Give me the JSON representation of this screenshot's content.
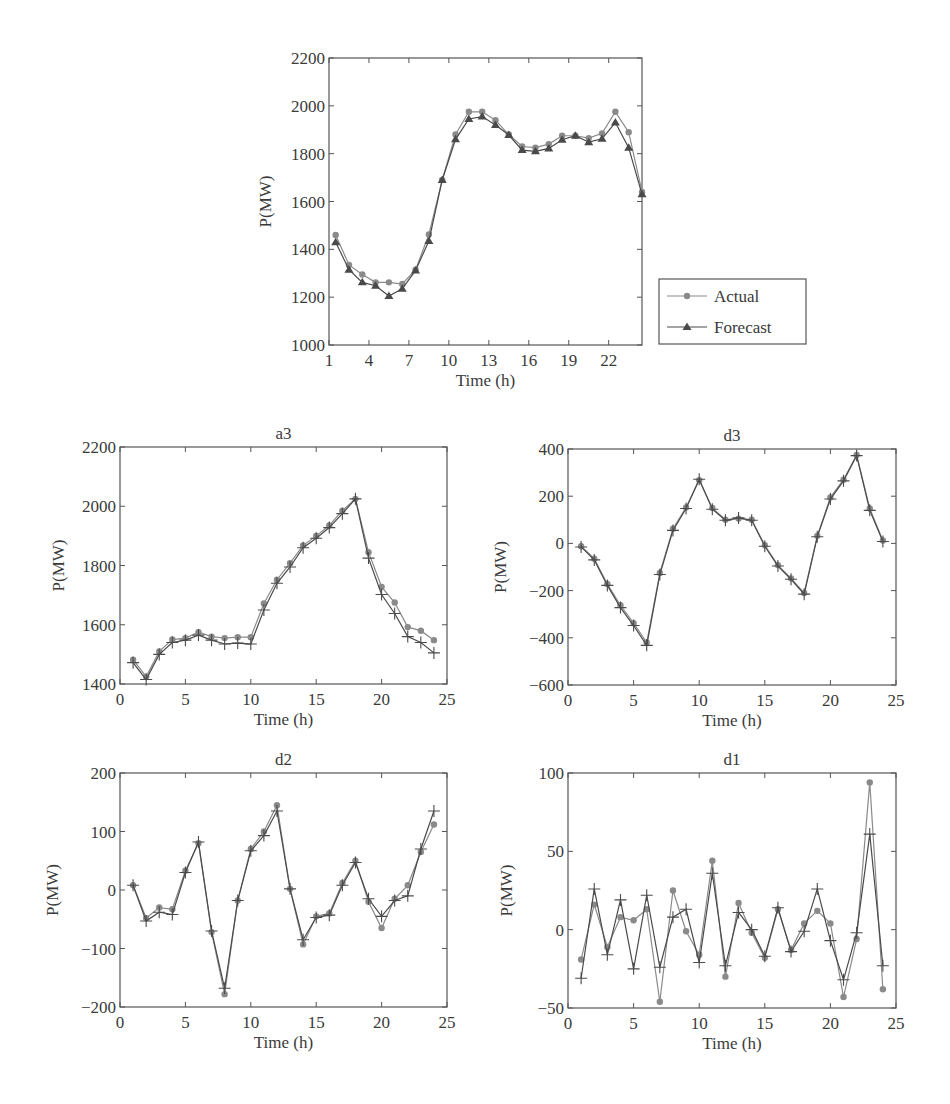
{
  "chart_data": [
    {
      "id": "main",
      "type": "line",
      "title": "",
      "xlabel": "Time (h)",
      "ylabel": "P(MW)",
      "xlim": [
        1,
        24.5
      ],
      "ylim": [
        1000,
        2200
      ],
      "xticks": [
        1,
        4,
        7,
        10,
        13,
        16,
        19,
        22
      ],
      "yticks": [
        1000,
        1200,
        1400,
        1600,
        1800,
        2000,
        2200
      ],
      "grid": false,
      "legend_position": "outside-right",
      "x": [
        1.5,
        2.5,
        3.5,
        4.5,
        5.5,
        6.5,
        7.5,
        8.5,
        9.5,
        10.5,
        11.5,
        12.5,
        13.5,
        14.5,
        15.5,
        16.5,
        17.5,
        18.5,
        19.5,
        20.5,
        21.5,
        22.5,
        23.5,
        24.5
      ],
      "series": [
        {
          "name": "Actual",
          "marker": "circle",
          "color": "#8a8a8a",
          "values": [
            1460,
            1335,
            1295,
            1262,
            1262,
            1255,
            1315,
            1462,
            1690,
            1880,
            1975,
            1975,
            1940,
            1880,
            1830,
            1825,
            1840,
            1875,
            1875,
            1865,
            1885,
            1975,
            1890,
            1640
          ]
        },
        {
          "name": "Forecast",
          "marker": "triangle",
          "color": "#4a4a4a",
          "values": [
            1430,
            1315,
            1262,
            1248,
            1205,
            1235,
            1312,
            1435,
            1690,
            1860,
            1945,
            1955,
            1920,
            1878,
            1815,
            1810,
            1822,
            1858,
            1875,
            1848,
            1862,
            1930,
            1825,
            1630
          ]
        }
      ]
    },
    {
      "id": "a3",
      "type": "line",
      "title": "a3",
      "xlabel": "Time (h)",
      "ylabel": "P(MW)",
      "xlim": [
        0,
        25
      ],
      "ylim": [
        1400,
        2200
      ],
      "xticks": [
        0,
        5,
        10,
        15,
        20,
        25
      ],
      "yticks": [
        1400,
        1600,
        1800,
        2000,
        2200
      ],
      "grid": false,
      "x": [
        1,
        2,
        3,
        4,
        5,
        6,
        7,
        8,
        9,
        10,
        11,
        12,
        13,
        14,
        15,
        16,
        17,
        18,
        19,
        20,
        21,
        22,
        23,
        24
      ],
      "series": [
        {
          "name": "Actual",
          "marker": "circle",
          "color": "#8a8a8a",
          "values": [
            1482,
            1425,
            1510,
            1550,
            1555,
            1575,
            1560,
            1555,
            1558,
            1558,
            1672,
            1752,
            1808,
            1868,
            1900,
            1935,
            1985,
            2025,
            1845,
            1728,
            1675,
            1592,
            1580,
            1548
          ]
        },
        {
          "name": "Forecast",
          "marker": "plus",
          "color": "#4a4a4a",
          "values": [
            1472,
            1415,
            1500,
            1540,
            1548,
            1565,
            1548,
            1535,
            1538,
            1535,
            1650,
            1740,
            1795,
            1860,
            1892,
            1928,
            1975,
            2025,
            1825,
            1702,
            1638,
            1560,
            1540,
            1505
          ]
        }
      ]
    },
    {
      "id": "d3",
      "type": "line",
      "title": "d3",
      "xlabel": "Time (h)",
      "ylabel": "P(MW)",
      "xlim": [
        0,
        25
      ],
      "ylim": [
        -600,
        400
      ],
      "xticks": [
        0,
        5,
        10,
        15,
        20,
        25
      ],
      "yticks": [
        -600,
        -400,
        -200,
        0,
        200,
        400
      ],
      "grid": false,
      "x": [
        1,
        2,
        3,
        4,
        5,
        6,
        7,
        8,
        9,
        10,
        11,
        12,
        13,
        14,
        15,
        16,
        17,
        18,
        19,
        20,
        21,
        22,
        23,
        24
      ],
      "series": [
        {
          "name": "Actual",
          "marker": "circle",
          "color": "#8a8a8a",
          "values": [
            -12,
            -65,
            -172,
            -262,
            -338,
            -420,
            -125,
            62,
            152,
            268,
            150,
            100,
            105,
            100,
            -8,
            -92,
            -148,
            -210,
            32,
            195,
            270,
            375,
            148,
            12
          ]
        },
        {
          "name": "Forecast",
          "marker": "plus",
          "color": "#4a4a4a",
          "values": [
            -15,
            -70,
            -178,
            -272,
            -348,
            -432,
            -132,
            55,
            148,
            272,
            145,
            98,
            108,
            98,
            -12,
            -96,
            -152,
            -215,
            28,
            188,
            265,
            372,
            140,
            8
          ]
        }
      ]
    },
    {
      "id": "d2",
      "type": "line",
      "title": "d2",
      "xlabel": "Time (h)",
      "ylabel": "P(MW)",
      "xlim": [
        0,
        25
      ],
      "ylim": [
        -200,
        200
      ],
      "xticks": [
        0,
        5,
        10,
        15,
        20,
        25
      ],
      "yticks": [
        -200,
        -100,
        0,
        100,
        200
      ],
      "grid": false,
      "x": [
        1,
        2,
        3,
        4,
        5,
        6,
        7,
        8,
        9,
        10,
        11,
        12,
        13,
        14,
        15,
        16,
        17,
        18,
        19,
        20,
        21,
        22,
        23,
        24
      ],
      "series": [
        {
          "name": "Actual",
          "marker": "circle",
          "color": "#8a8a8a",
          "values": [
            8,
            -48,
            -30,
            -33,
            33,
            80,
            -72,
            -178,
            -18,
            70,
            100,
            145,
            2,
            -93,
            -45,
            -40,
            12,
            50,
            -20,
            -65,
            -15,
            8,
            65,
            112
          ]
        },
        {
          "name": "Forecast",
          "marker": "plus",
          "color": "#4a4a4a",
          "values": [
            8,
            -53,
            -38,
            -42,
            30,
            82,
            -70,
            -168,
            -18,
            67,
            93,
            135,
            2,
            -85,
            -47,
            -43,
            8,
            47,
            -15,
            -45,
            -18,
            -10,
            70,
            135
          ]
        }
      ]
    },
    {
      "id": "d1",
      "type": "line",
      "title": "d1",
      "xlabel": "Time (h)",
      "ylabel": "P(MW)",
      "xlim": [
        0,
        25
      ],
      "ylim": [
        -50,
        100
      ],
      "xticks": [
        0,
        5,
        10,
        15,
        20,
        25
      ],
      "yticks": [
        -50,
        0,
        50,
        100
      ],
      "grid": false,
      "x": [
        1,
        2,
        3,
        4,
        5,
        6,
        7,
        8,
        9,
        10,
        11,
        12,
        13,
        14,
        15,
        16,
        17,
        18,
        19,
        20,
        21,
        22,
        23,
        24
      ],
      "series": [
        {
          "name": "Actual",
          "marker": "circle",
          "color": "#8a8a8a",
          "values": [
            -19,
            16,
            -11,
            8,
            6,
            13,
            -46,
            25,
            -1,
            -16,
            44,
            -30,
            17,
            -2,
            -18,
            13,
            -13,
            4,
            12,
            4,
            -43,
            -6,
            94,
            -38
          ]
        },
        {
          "name": "Forecast",
          "marker": "plus",
          "color": "#4a4a4a",
          "values": [
            -31,
            26,
            -16,
            19,
            -25,
            22,
            -24,
            8,
            13,
            -21,
            36,
            -23,
            11,
            0,
            -17,
            14,
            -14,
            -1,
            26,
            -7,
            -32,
            -2,
            61,
            -23
          ]
        }
      ]
    }
  ],
  "legend": {
    "items": [
      {
        "label": "Actual",
        "marker": "circle"
      },
      {
        "label": "Forecast",
        "marker": "triangle"
      }
    ]
  },
  "layout": {
    "main": {
      "left": 329,
      "top": 58,
      "right": 642,
      "bottom": 345
    },
    "a3": {
      "left": 120,
      "top": 447,
      "right": 447,
      "bottom": 684
    },
    "d3": {
      "left": 568,
      "top": 449,
      "right": 896,
      "bottom": 685
    },
    "d2": {
      "left": 120,
      "top": 773,
      "right": 447,
      "bottom": 1007
    },
    "d1": {
      "left": 568,
      "top": 773,
      "right": 896,
      "bottom": 1008
    }
  }
}
